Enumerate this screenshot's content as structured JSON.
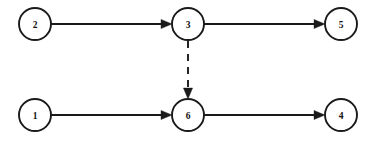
{
  "diagram": {
    "background_color": "#ffffff",
    "stroke_color": "#1a1a1a",
    "node_fill_color": "#ffffff",
    "canvas": {
      "width": 373,
      "height": 142
    },
    "node_radius": 16,
    "nodes": [
      {
        "id": "2",
        "label": "2",
        "cx": 35,
        "cy": 24,
        "row": "top"
      },
      {
        "id": "3",
        "label": "3",
        "cx": 188,
        "cy": 24,
        "row": "top"
      },
      {
        "id": "5",
        "label": "5",
        "cx": 341,
        "cy": 24,
        "row": "top"
      },
      {
        "id": "1",
        "label": "1",
        "cx": 35,
        "cy": 115,
        "row": "bottom"
      },
      {
        "id": "6",
        "label": "6",
        "cx": 188,
        "cy": 115,
        "row": "bottom"
      },
      {
        "id": "4",
        "label": "4",
        "cx": 341,
        "cy": 115,
        "row": "bottom"
      }
    ],
    "edges": [
      {
        "id": "edge-2-3",
        "from": "2",
        "to": "3",
        "style": "solid",
        "direction": "horizontal",
        "x1": 51,
        "y1": 24,
        "x2": 172,
        "y2": 24,
        "arrow": "end"
      },
      {
        "id": "edge-3-5",
        "from": "3",
        "to": "5",
        "style": "solid",
        "direction": "horizontal",
        "x1": 204,
        "y1": 24,
        "x2": 325,
        "y2": 24,
        "arrow": "end"
      },
      {
        "id": "edge-1-6",
        "from": "1",
        "to": "6",
        "style": "solid",
        "direction": "horizontal",
        "x1": 51,
        "y1": 115,
        "x2": 172,
        "y2": 115,
        "arrow": "end"
      },
      {
        "id": "edge-6-4",
        "from": "6",
        "to": "4",
        "style": "solid",
        "direction": "horizontal",
        "x1": 204,
        "y1": 115,
        "x2": 325,
        "y2": 115,
        "arrow": "end"
      },
      {
        "id": "edge-3-6",
        "from": "3",
        "to": "6",
        "style": "dashed",
        "direction": "vertical",
        "x1": 188,
        "y1": 41,
        "x2": 188,
        "y2": 99,
        "arrow": "end"
      }
    ],
    "legend": {
      "solid_meaning": "solid-arrow",
      "dashed_meaning": "dashed-arrow"
    }
  }
}
